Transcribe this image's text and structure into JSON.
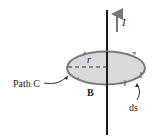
{
  "diagram": {
    "labels": {
      "current": "I",
      "radius": "r",
      "path": "Path C",
      "field": "B",
      "element": "ds"
    },
    "colors": {
      "wire": "#1a1a1a",
      "loop_fill": "#d9d9d9",
      "loop_stroke": "#7a7a7a",
      "arrow": "#777777",
      "text": "#222222"
    }
  }
}
